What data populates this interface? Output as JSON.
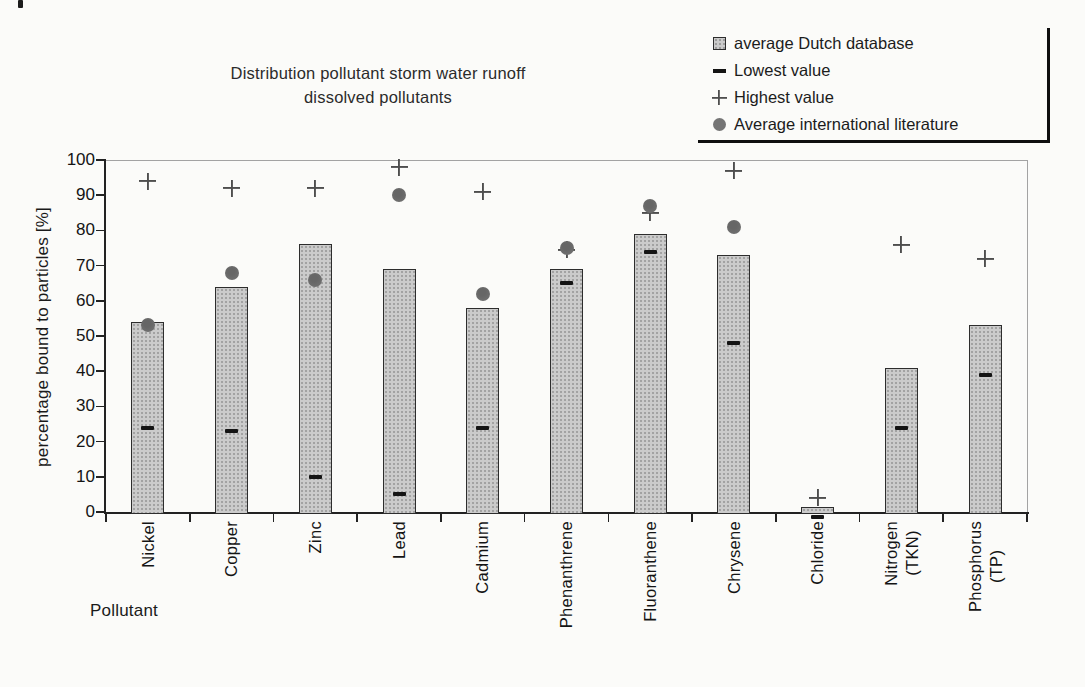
{
  "chart_data": {
    "type": "bar",
    "title_lines": [
      "Distribution pollutant storm water runoff",
      "dissolved pollutants"
    ],
    "ylabel": "percentage bound to particles [%]",
    "xlabel": "Pollutant",
    "ylim": [
      0,
      100
    ],
    "yticks": [
      0,
      10,
      20,
      30,
      40,
      50,
      60,
      70,
      80,
      90,
      100
    ],
    "grid": false,
    "legend_position": "top-right",
    "categories": [
      "Nickel",
      "Copper",
      "Zinc",
      "Lead",
      "Cadmium",
      "Phenanthrene",
      "Fluoranthene",
      "Chrysene",
      "Chloride",
      "Nitrogen\n(TKN)",
      "Phosphorus\n(TP)"
    ],
    "series": [
      {
        "name": "average Dutch database",
        "marker": "square",
        "role": "bar",
        "values": [
          54,
          64,
          76,
          69,
          58,
          69,
          79,
          73,
          1.5,
          41,
          53
        ]
      },
      {
        "name": "Lowest value",
        "marker": "dash",
        "role": "point",
        "values": [
          24,
          23,
          10,
          5,
          24,
          65,
          74,
          48,
          -1.5,
          24,
          39
        ]
      },
      {
        "name": "Highest value",
        "marker": "plus",
        "role": "point",
        "values": [
          94,
          92,
          92,
          98,
          91,
          74.5,
          85,
          97,
          4,
          76,
          72
        ]
      },
      {
        "name": "Average international literature",
        "marker": "circle",
        "role": "point",
        "values": [
          53,
          68,
          66,
          90,
          62,
          75,
          87,
          81,
          null,
          null,
          null
        ]
      }
    ],
    "colors": {
      "bar_fill": "#cbcbcb",
      "bar_border": "#2d2d2d",
      "dash": "#141414",
      "plus": "#4e4e4e",
      "circle": "#757575",
      "axis": "#222222",
      "frame": "#a3a3a3",
      "text": "#1d1d1d"
    }
  }
}
